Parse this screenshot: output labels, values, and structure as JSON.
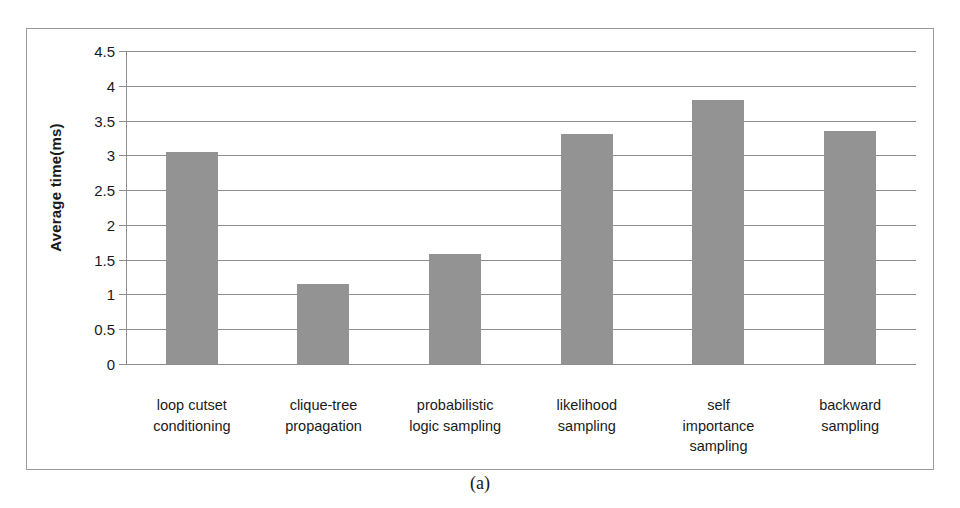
{
  "figure": {
    "caption": "(a)"
  },
  "chart_data": {
    "type": "bar",
    "title": "",
    "xlabel": "",
    "ylabel": "Average time(ms)",
    "ylim": [
      0,
      4.5
    ],
    "yticks": [
      "0",
      "0.5",
      "1",
      "1.5",
      "2",
      "2.5",
      "3",
      "3.5",
      "4",
      "4.5"
    ],
    "ytick_values": [
      0,
      0.5,
      1,
      1.5,
      2,
      2.5,
      3,
      3.5,
      4,
      4.5
    ],
    "grid": true,
    "legend": null,
    "bar_color": "#939393",
    "categories": [
      "loop cutset conditioning",
      "clique-tree propagation",
      "probabilistic logic sampling",
      "likelihood sampling",
      "self importance sampling",
      "backward sampling"
    ],
    "category_lines": [
      [
        "loop cutset",
        "conditioning"
      ],
      [
        "clique-tree",
        "propagation"
      ],
      [
        "probabilistic",
        "logic sampling"
      ],
      [
        "likelihood",
        "sampling"
      ],
      [
        "self",
        "importance",
        "sampling"
      ],
      [
        "backward",
        "sampling"
      ]
    ],
    "values": [
      3.05,
      1.15,
      1.58,
      3.3,
      3.8,
      3.35
    ]
  }
}
